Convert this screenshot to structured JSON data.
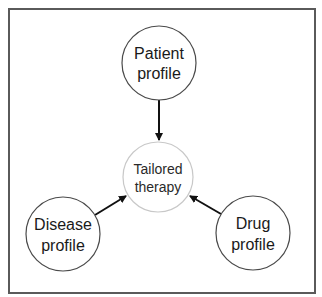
{
  "diagram": {
    "colors": {
      "frame": "#5a5a5a",
      "node_stroke": "#4a4a4a",
      "center_stroke": "#c8c8c8",
      "arrow": "#111111",
      "text": "#1a1a1a"
    },
    "nodes": {
      "patient": {
        "line1": "Patient",
        "line2": "profile"
      },
      "center": {
        "line1": "Tailored",
        "line2": "therapy"
      },
      "disease": {
        "line1": "Disease",
        "line2": "profile"
      },
      "drug": {
        "line1": "Drug",
        "line2": "profile"
      }
    },
    "edges": [
      {
        "from": "Patient profile",
        "to": "Tailored therapy"
      },
      {
        "from": "Disease profile",
        "to": "Tailored therapy"
      },
      {
        "from": "Drug profile",
        "to": "Tailored therapy"
      }
    ]
  }
}
